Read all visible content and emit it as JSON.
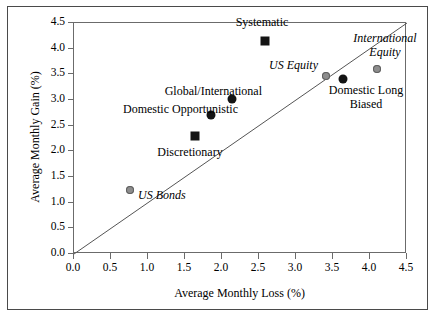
{
  "chart_data": {
    "type": "scatter",
    "title": "",
    "xlabel": "Average Monthly Loss (%)",
    "ylabel": "Average Monthly Gain (%)",
    "xlim": [
      0.0,
      4.5
    ],
    "ylim": [
      0.0,
      4.5
    ],
    "xticks": [
      "0.0",
      "0.5",
      "1.0",
      "1.5",
      "2.0",
      "2.5",
      "3.0",
      "3.5",
      "4.0",
      "4.5"
    ],
    "yticks": [
      "0.0",
      "0.5",
      "1.0",
      "1.5",
      "2.0",
      "2.5",
      "3.0",
      "3.5",
      "4.0",
      "4.5"
    ],
    "grid": false,
    "legend": "none",
    "reference_line": {
      "name": "45-degree-line",
      "from": [
        0.0,
        0.0
      ],
      "to": [
        4.5,
        4.5
      ],
      "color": "#555555"
    },
    "points": [
      {
        "label": "Systematic",
        "x": 2.58,
        "y": 4.14,
        "marker": "square",
        "color": "#141414",
        "style": "normal"
      },
      {
        "label": "Global/International",
        "x": 2.13,
        "y": 3.01,
        "marker": "circle",
        "color": "#141414",
        "style": "normal"
      },
      {
        "label": "Domestic Opportunistic",
        "x": 1.85,
        "y": 2.7,
        "marker": "circle",
        "color": "#141414",
        "style": "normal"
      },
      {
        "label": "Discretionary",
        "x": 1.64,
        "y": 2.29,
        "marker": "square",
        "color": "#141414",
        "style": "normal"
      },
      {
        "label": "US Equity",
        "x": 3.4,
        "y": 3.46,
        "marker": "circle",
        "color": "#8d8d8d",
        "style": "italic"
      },
      {
        "label": "International Equity",
        "x": 4.1,
        "y": 3.6,
        "marker": "circle",
        "color": "#8d8d8d",
        "style": "italic"
      },
      {
        "label": "Domestic Long Biased",
        "x": 3.63,
        "y": 3.4,
        "marker": "circle",
        "color": "#141414",
        "style": "normal"
      },
      {
        "label": "US Bonds",
        "x": 0.76,
        "y": 1.25,
        "marker": "circle",
        "color": "#8d8d8d",
        "style": "italic"
      }
    ]
  },
  "labels": {
    "systematic": "Systematic",
    "global_international": "Global/International",
    "domestic_opportunistic": "Domestic Opportunistic",
    "discretionary": "Discretionary",
    "us_equity": "US Equity",
    "international_equity_line1": "International",
    "international_equity_line2": "Equity",
    "domestic_long_biased_line1": "Domestic Long",
    "domestic_long_biased_line2": "Biased",
    "us_bonds": "US Bonds"
  }
}
